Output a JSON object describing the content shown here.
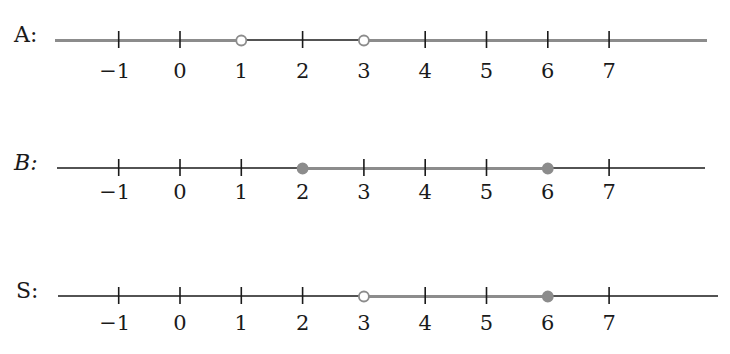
{
  "colors": {
    "axis": "#1a1a1a",
    "highlight": "#8c8c8c",
    "open_fill": "#ffffff"
  },
  "axis": {
    "min": -1,
    "max": 7,
    "ticks": [
      -1,
      0,
      1,
      2,
      3,
      4,
      5,
      6,
      7
    ],
    "tick_labels": [
      "−1",
      "0",
      "1",
      "2",
      "3",
      "4",
      "5",
      "6",
      "7"
    ]
  },
  "rows": [
    {
      "id": "A",
      "label": "A:",
      "italic": false,
      "description": "x < 1 or x > 3",
      "segments": [
        {
          "from": "-inf",
          "to": 1
        },
        {
          "from": 3,
          "to": "+inf"
        }
      ],
      "endpoints": [
        {
          "value": 1,
          "type": "open"
        },
        {
          "value": 3,
          "type": "open"
        }
      ]
    },
    {
      "id": "B",
      "label": "B:",
      "italic": true,
      "description": "2 ≤ x ≤ 6",
      "segments": [
        {
          "from": 2,
          "to": 6
        }
      ],
      "endpoints": [
        {
          "value": 2,
          "type": "closed"
        },
        {
          "value": 6,
          "type": "closed"
        }
      ]
    },
    {
      "id": "S",
      "label": "S:",
      "italic": false,
      "description": "3 < x ≤ 6",
      "segments": [
        {
          "from": 3,
          "to": 6
        }
      ],
      "endpoints": [
        {
          "value": 3,
          "type": "open"
        },
        {
          "value": 6,
          "type": "closed"
        }
      ]
    }
  ]
}
